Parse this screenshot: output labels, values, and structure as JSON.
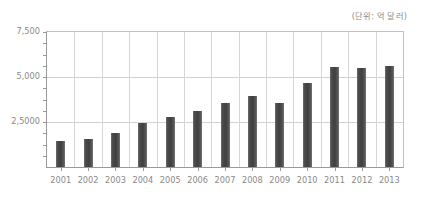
{
  "chart_data": {
    "type": "bar",
    "title": "",
    "subtitle": "",
    "unit_note": "(단위: 억 달러)",
    "xlabel": "",
    "ylabel": "",
    "categories": [
      "2001",
      "2002",
      "2003",
      "2004",
      "2005",
      "2006",
      "2007",
      "2008",
      "2009",
      "2010",
      "2011",
      "2012",
      "2013"
    ],
    "values": [
      1430,
      1540,
      1870,
      2430,
      2770,
      3100,
      3550,
      3940,
      3550,
      4650,
      5550,
      5490,
      5600
    ],
    "series": [
      {
        "name": "",
        "values": [
          1430,
          1540,
          1870,
          2430,
          2770,
          3100,
          3550,
          3940,
          3550,
          4650,
          5550,
          5490,
          5600
        ]
      }
    ],
    "ylim": [
      0,
      7500
    ],
    "ytick_labels": [
      "2,5000",
      "5,000",
      "7,500"
    ],
    "ytick_values": [
      2500,
      5000,
      7500
    ],
    "minor_ytick_values": [
      625,
      1250,
      1875,
      3125,
      3750,
      4375,
      5625,
      6250,
      6875
    ],
    "grid": true,
    "grid_horizontal": true,
    "grid_vertical": true,
    "legend": false,
    "legend_position": "none",
    "bar_color": "#4b4b4b",
    "grid_color": "#d2d2d2",
    "axis_color": "#9a9a9a",
    "text_color": "#8a8a8a",
    "background": "#ffffff"
  }
}
